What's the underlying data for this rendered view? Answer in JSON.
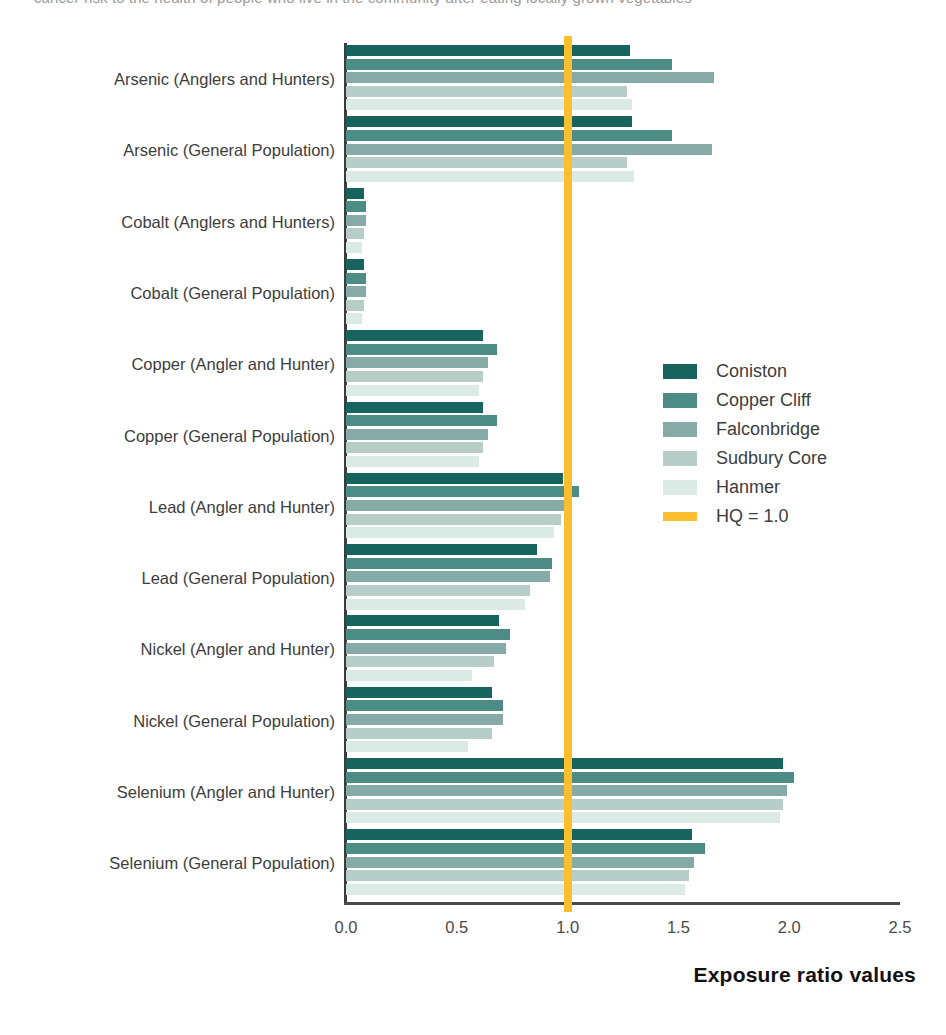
{
  "top_partial_text": "cancer risk to the health of people who live in the community after eating locally grown vegetables",
  "axis": {
    "x_title": "Exposure ratio values",
    "ticks": [
      "0.0",
      "0.5",
      "1.0",
      "1.5",
      "2.0",
      "2.5"
    ],
    "tick_values": [
      0.0,
      0.5,
      1.0,
      1.5,
      2.0,
      2.5
    ]
  },
  "legend": {
    "items": [
      {
        "label": "Coniston",
        "color": "#17645f"
      },
      {
        "label": "Copper Cliff",
        "color": "#4d8b85"
      },
      {
        "label": "Falconbridge",
        "color": "#86aaa6"
      },
      {
        "label": "Sudbury Core",
        "color": "#b6cdc8"
      },
      {
        "label": "Hanmer",
        "color": "#dceae6"
      },
      {
        "label": "HQ = 1.0",
        "color": "#fbbe2e"
      }
    ]
  },
  "chart_data": {
    "type": "bar",
    "orientation": "horizontal",
    "title": "",
    "xlabel": "Exposure ratio values",
    "ylabel": "",
    "xlim": [
      0.0,
      2.5
    ],
    "grid": false,
    "legend_position": "center-right",
    "reference_line": {
      "label": "HQ = 1.0",
      "value": 1.0,
      "color": "#fbbe2e"
    },
    "categories": [
      "Arsenic (Anglers and Hunters)",
      "Arsenic (General Population)",
      "Cobalt  (Anglers and Hunters)",
      "Cobalt  (General Population)",
      "Copper (Angler and Hunter)",
      "Copper (General Population)",
      "Lead  (Angler and Hunter)",
      "Lead (General Population)",
      "Nickel (Angler and Hunter)",
      "Nickel (General Population)",
      "Selenium (Angler and Hunter)",
      "Selenium (General Population)"
    ],
    "series": [
      {
        "name": "Coniston",
        "color": "#17645f",
        "values": [
          1.28,
          1.29,
          0.08,
          0.08,
          0.62,
          0.62,
          0.98,
          0.86,
          0.69,
          0.66,
          1.97,
          1.56
        ]
      },
      {
        "name": "Copper Cliff",
        "color": "#4d8b85",
        "values": [
          1.47,
          1.47,
          0.09,
          0.09,
          0.68,
          0.68,
          1.05,
          0.93,
          0.74,
          0.71,
          2.02,
          1.62
        ]
      },
      {
        "name": "Falconbridge",
        "color": "#86aaa6",
        "values": [
          1.66,
          1.65,
          0.09,
          0.09,
          0.64,
          0.64,
          1.01,
          0.92,
          0.72,
          0.71,
          1.99,
          1.57
        ]
      },
      {
        "name": "Sudbury Core",
        "color": "#b6cdc8",
        "values": [
          1.27,
          1.27,
          0.08,
          0.08,
          0.62,
          0.62,
          0.97,
          0.83,
          0.67,
          0.66,
          1.97,
          1.55
        ]
      },
      {
        "name": "Hanmer",
        "color": "#dceae6",
        "values": [
          1.29,
          1.3,
          0.07,
          0.07,
          0.6,
          0.6,
          0.94,
          0.81,
          0.57,
          0.55,
          1.96,
          1.53
        ]
      }
    ]
  }
}
